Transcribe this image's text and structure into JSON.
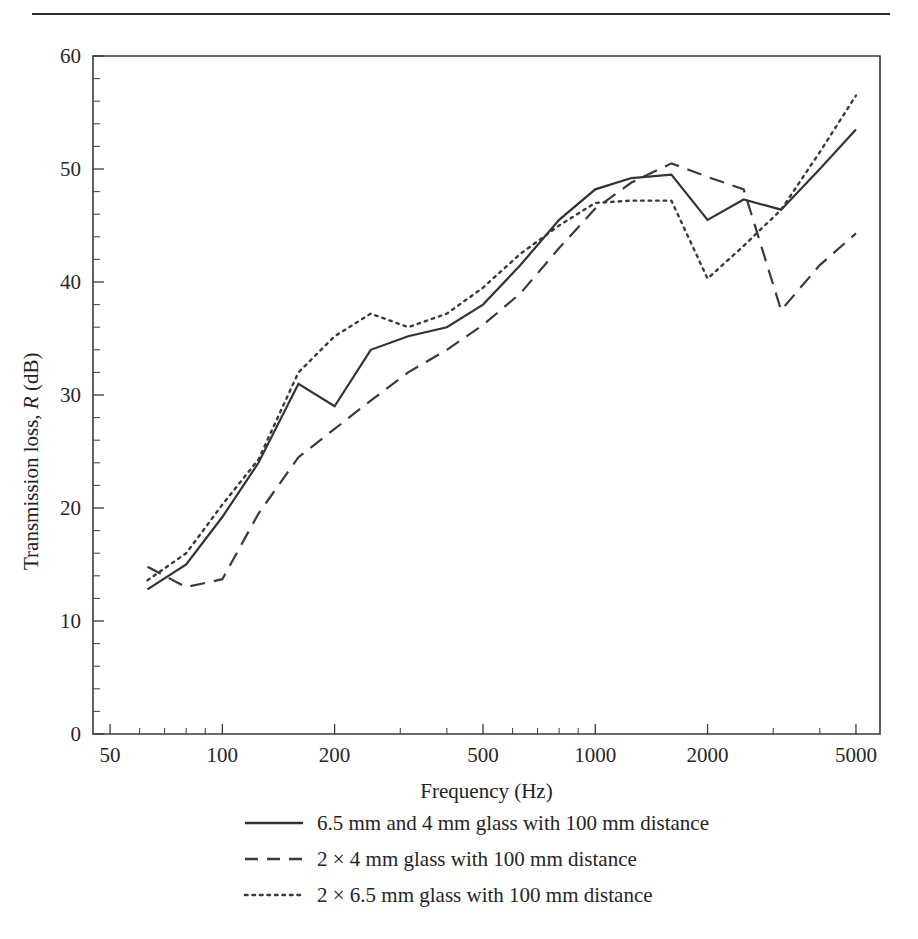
{
  "figure": {
    "top_rule": true,
    "xlabel": "Frequency (Hz)",
    "ylabel_parts": {
      "pre": "Transmission loss, ",
      "italic": "R",
      "post": " (dB)"
    },
    "ylabel_full": "Transmission loss, R (dB)"
  },
  "legend": {
    "items": [
      {
        "style": "solid",
        "label": "6.5 mm and 4 mm glass with 100 mm distance"
      },
      {
        "style": "dashed",
        "label": "2 × 4 mm glass with 100 mm distance"
      },
      {
        "style": "dotted",
        "label": "2 × 6.5 mm glass with 100 mm distance"
      }
    ]
  },
  "chart_data": {
    "type": "line",
    "title": "",
    "xlabel": "Frequency (Hz)",
    "ylabel": "Transmission loss, R (dB)",
    "xscale": "log",
    "xlim": [
      45,
      5800
    ],
    "ylim": [
      0,
      60
    ],
    "grid": false,
    "legend_position": "below",
    "xtick_labels": [
      "50",
      "100",
      "200",
      "500",
      "1000",
      "2000",
      "5000"
    ],
    "xtick_values": [
      50,
      100,
      200,
      500,
      1000,
      2000,
      5000
    ],
    "ytick_labels": [
      "0",
      "10",
      "20",
      "30",
      "40",
      "50",
      "60"
    ],
    "ytick_values": [
      0,
      10,
      20,
      30,
      40,
      50,
      60
    ],
    "yminor_step": 2,
    "series": [
      {
        "name": "6.5 mm and 4 mm glass with 100 mm distance",
        "style": "solid",
        "x": [
          63,
          80,
          100,
          125,
          160,
          200,
          250,
          315,
          400,
          500,
          630,
          800,
          1000,
          1250,
          1600,
          2000,
          2500,
          3150,
          4000,
          5000
        ],
        "values": [
          12.8,
          15.0,
          19.2,
          24.0,
          31.0,
          29.0,
          34.0,
          35.2,
          36.0,
          38.0,
          41.5,
          45.5,
          48.2,
          49.2,
          49.5,
          45.5,
          47.3,
          46.4,
          50.0,
          53.5
        ]
      },
      {
        "name": "2 × 4 mm glass with 100 mm distance",
        "style": "dashed",
        "x": [
          63,
          80,
          100,
          125,
          160,
          200,
          250,
          315,
          400,
          500,
          630,
          800,
          1000,
          1250,
          1600,
          2000,
          2500,
          3150,
          4000,
          5000
        ],
        "values": [
          14.8,
          13.0,
          13.7,
          19.5,
          24.5,
          27.0,
          29.5,
          32.0,
          34.0,
          36.2,
          39.0,
          43.0,
          46.5,
          48.8,
          50.5,
          49.3,
          48.2,
          37.5,
          41.5,
          44.3
        ]
      },
      {
        "name": "2 × 6.5 mm glass with 100 mm distance",
        "style": "dotted",
        "x": [
          63,
          80,
          100,
          125,
          160,
          200,
          250,
          315,
          400,
          500,
          630,
          800,
          1000,
          1250,
          1600,
          2000,
          2500,
          3150,
          4000,
          5000
        ],
        "values": [
          13.6,
          16.0,
          20.3,
          24.3,
          32.0,
          35.2,
          37.2,
          36.0,
          37.2,
          39.5,
          42.5,
          45.0,
          47.0,
          47.2,
          47.2,
          40.3,
          43.2,
          46.4,
          51.5,
          56.5
        ]
      }
    ]
  }
}
